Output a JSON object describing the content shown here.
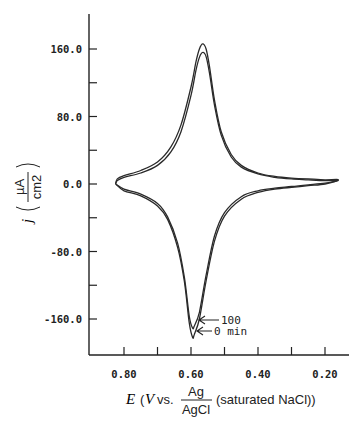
{
  "chart_data": {
    "type": "line",
    "title": "",
    "xlabel": "E (V vs. Ag/AgCl (saturated NaCl))",
    "xlabel_parts": {
      "var": "E",
      "open": "(",
      "unit": "V",
      "vs": "vs.",
      "frac_num": "Ag",
      "frac_den": "AgCl",
      "rest": "(saturated NaCl))"
    },
    "ylabel": "j (µA/cm2)",
    "ylabel_parts": {
      "var": "j",
      "frac_num": "µA",
      "frac_den": "cm2"
    },
    "xlim": [
      0.835,
      0.13
    ],
    "ylim": [
      -200,
      200
    ],
    "x_inverted": true,
    "x_ticks": [
      "0.80",
      "0.60",
      "0.40",
      "0.20"
    ],
    "x_tick_values": [
      0.8,
      0.6,
      0.4,
      0.2
    ],
    "x_minor_ticks": [
      0.7,
      0.5,
      0.3
    ],
    "y_ticks": [
      "160.0",
      "80.0",
      "0.0",
      "-80.0",
      "-160.0"
    ],
    "y_tick_values": [
      160,
      80,
      0,
      -80,
      -160
    ],
    "y_minor_ticks": [
      120,
      40,
      -40,
      -120
    ],
    "grid": false,
    "legend": "none",
    "annotations": [
      {
        "text": "100",
        "points_to": "cathodic peak of 100 min curve",
        "x": 0.595,
        "y": -170
      },
      {
        "text": "0 min",
        "points_to": "cathodic peak of 0 min curve",
        "x": 0.595,
        "y": -182
      }
    ],
    "series": [
      {
        "name": "0 min",
        "anodic_sweep": {
          "x": [
            0.825,
            0.82,
            0.8,
            0.75,
            0.7,
            0.66,
            0.63,
            0.6,
            0.585,
            0.575,
            0.565,
            0.555,
            0.545,
            0.53,
            0.51,
            0.48,
            0.45,
            0.4,
            0.35,
            0.3,
            0.25,
            0.2,
            0.16
          ],
          "y": [
            0,
            6,
            10,
            16,
            26,
            44,
            70,
            115,
            145,
            160,
            166,
            160,
            140,
            100,
            62,
            35,
            22,
            13,
            9,
            7,
            6,
            5,
            5
          ]
        },
        "cathodic_sweep": {
          "x": [
            0.16,
            0.2,
            0.25,
            0.3,
            0.35,
            0.4,
            0.45,
            0.5,
            0.53,
            0.555,
            0.575,
            0.59,
            0.595,
            0.605,
            0.62,
            0.64,
            0.67,
            0.7,
            0.75,
            0.8,
            0.825
          ],
          "y": [
            5,
            0,
            -2,
            -4,
            -6,
            -10,
            -18,
            -38,
            -68,
            -115,
            -160,
            -178,
            -182,
            -165,
            -115,
            -75,
            -42,
            -26,
            -14,
            -8,
            0
          ]
        }
      },
      {
        "name": "100 min",
        "anodic_sweep": {
          "x": [
            0.825,
            0.82,
            0.8,
            0.75,
            0.7,
            0.66,
            0.63,
            0.6,
            0.585,
            0.575,
            0.565,
            0.555,
            0.545,
            0.53,
            0.51,
            0.48,
            0.45,
            0.4,
            0.35,
            0.3,
            0.25,
            0.2,
            0.16
          ],
          "y": [
            0,
            4,
            8,
            13,
            22,
            38,
            62,
            105,
            135,
            150,
            156,
            151,
            132,
            94,
            58,
            32,
            20,
            12,
            8,
            6,
            5,
            4,
            4
          ]
        },
        "cathodic_sweep": {
          "x": [
            0.16,
            0.2,
            0.25,
            0.3,
            0.35,
            0.4,
            0.45,
            0.5,
            0.53,
            0.555,
            0.575,
            0.59,
            0.595,
            0.605,
            0.62,
            0.64,
            0.67,
            0.7,
            0.75,
            0.8,
            0.825
          ],
          "y": [
            4,
            1,
            -1,
            -3,
            -5,
            -8,
            -15,
            -34,
            -62,
            -108,
            -152,
            -168,
            -171,
            -157,
            -110,
            -70,
            -39,
            -23,
            -12,
            -6,
            0
          ]
        }
      }
    ]
  }
}
